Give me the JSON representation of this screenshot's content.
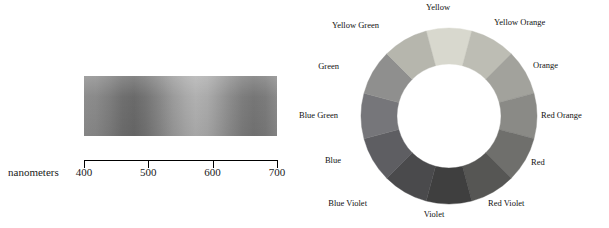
{
  "spectrum": {
    "axis_title": "nanometers",
    "ticks": [
      {
        "label": "400",
        "pos_pct": 0
      },
      {
        "label": "500",
        "pos_pct": 33.3
      },
      {
        "label": "600",
        "pos_pct": 66.6
      },
      {
        "label": "700",
        "pos_pct": 100
      }
    ],
    "band_colors_start": "#8d8d8d",
    "band_colors_end": "#8a8a8a"
  },
  "wheel": {
    "segments": [
      {
        "name": "Yellow",
        "color": "#d8d8ce",
        "angle_deg": 0
      },
      {
        "name": "Yellow Orange",
        "color": "#bdbdb4",
        "angle_deg": 30
      },
      {
        "name": "Orange",
        "color": "#a2a29c",
        "angle_deg": 60
      },
      {
        "name": "Red Orange",
        "color": "#8a8a86",
        "angle_deg": 90
      },
      {
        "name": "Red",
        "color": "#6f6f6c",
        "angle_deg": 120
      },
      {
        "name": "Red Violet",
        "color": "#565654",
        "angle_deg": 150
      },
      {
        "name": "Violet",
        "color": "#3f3f3f",
        "angle_deg": 180
      },
      {
        "name": "Blue Violet",
        "color": "#4a4a4c",
        "angle_deg": 210
      },
      {
        "name": "Blue",
        "color": "#5e5e62",
        "angle_deg": 240
      },
      {
        "name": "Blue Green",
        "color": "#76767a",
        "angle_deg": 270
      },
      {
        "name": "Green",
        "color": "#8f8f8e",
        "angle_deg": 300
      },
      {
        "name": "Yellow Green",
        "color": "#b6b6ad",
        "angle_deg": 330
      }
    ],
    "labels": [
      {
        "text": "Yellow",
        "x": 128,
        "y": 2,
        "anchor": "center"
      },
      {
        "text": "Yellow Orange",
        "x": 184,
        "y": 17,
        "anchor": "left"
      },
      {
        "text": "Orange",
        "x": 223,
        "y": 60,
        "anchor": "left"
      },
      {
        "text": "Red Orange",
        "x": 231,
        "y": 110,
        "anchor": "left"
      },
      {
        "text": "Red",
        "x": 221,
        "y": 157,
        "anchor": "left"
      },
      {
        "text": "Red Violet",
        "x": 178,
        "y": 198,
        "anchor": "left"
      },
      {
        "text": "Violet",
        "x": 124,
        "y": 209,
        "anchor": "center"
      },
      {
        "text": "Blue Violet",
        "x": 57,
        "y": 198,
        "anchor": "right"
      },
      {
        "text": "Blue",
        "x": 31,
        "y": 155,
        "anchor": "right"
      },
      {
        "text": "Blue Green",
        "x": 28,
        "y": 110,
        "anchor": "right"
      },
      {
        "text": "Green",
        "x": 29,
        "y": 61,
        "anchor": "right"
      },
      {
        "text": "Yellow Green",
        "x": 69,
        "y": 20,
        "anchor": "right"
      }
    ]
  }
}
